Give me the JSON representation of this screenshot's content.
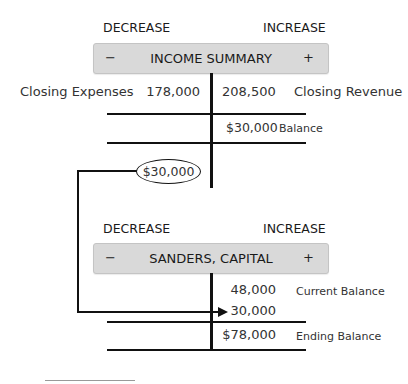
{
  "income_summary": {
    "decrease_label": "DECREASE",
    "increase_label": "INCREASE",
    "minus_sign": "−",
    "plus_sign": "+",
    "title": "INCOME SUMMARY",
    "rows": [
      {
        "left_label": "Closing Expenses",
        "debit": "178,000",
        "credit": "208,500",
        "right_label": "Closing Revenue"
      }
    ],
    "balance": {
      "credit": "$30,000",
      "label": "Balance"
    }
  },
  "transfer": {
    "amount": "$30,000"
  },
  "capital": {
    "decrease_label": "DECREASE",
    "increase_label": "INCREASE",
    "minus_sign": "−",
    "plus_sign": "+",
    "title": "SANDERS, CAPITAL",
    "rows": [
      {
        "credit": "48,000",
        "right_label": "Current Balance"
      },
      {
        "credit": "30,000",
        "right_label": ""
      }
    ],
    "ending": {
      "credit": "$78,000",
      "label": "Ending Balance"
    }
  },
  "colors": {
    "header_box_bg": "#d9d9d9",
    "line": "#111111",
    "footnote_rule": "#999999"
  }
}
